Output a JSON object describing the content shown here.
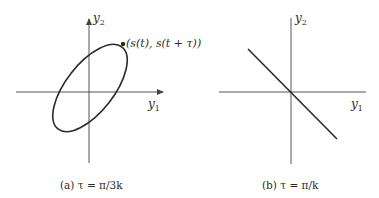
{
  "panels": [
    {
      "id": "a",
      "caption_prefix": "(a)",
      "caption": "(a) τ = π/3k",
      "x_axis_label": "y",
      "x_axis_sub": "1",
      "y_axis_label": "y",
      "y_axis_sub": "2",
      "point_label": "(s(t), s(t + τ))",
      "curve": "ellipse"
    },
    {
      "id": "b",
      "caption_prefix": "(b)",
      "caption": "(b) τ = π/k",
      "x_axis_label": "y",
      "x_axis_sub": "1",
      "y_axis_label": "y",
      "y_axis_sub": "2",
      "curve": "line"
    }
  ],
  "colors": {
    "stroke": "#2a2a2a",
    "axis": "#555555"
  }
}
